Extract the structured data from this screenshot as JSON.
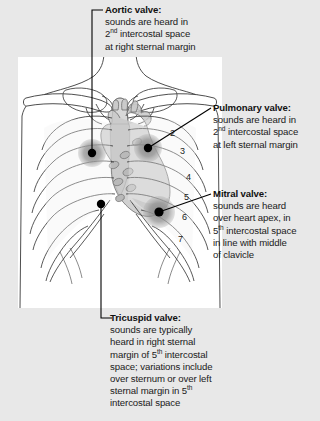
{
  "figure": {
    "title_semantic": "cardiac-auscultation-sites-diagram",
    "background_color": "#e8e8e8",
    "panel_color": "#ffffff"
  },
  "callouts": [
    {
      "id": "aortic",
      "heading": "Aortic valve:",
      "lines": [
        {
          "pre": "sounds are heard in",
          "sup": "",
          "post": ""
        },
        {
          "pre": "2",
          "sup": "nd",
          "post": " intercostal space"
        },
        {
          "pre": "at right sternal margin",
          "sup": "",
          "post": ""
        }
      ]
    },
    {
      "id": "pulmonary",
      "heading": "Pulmonary valve:",
      "lines": [
        {
          "pre": "sounds are heard in",
          "sup": "",
          "post": ""
        },
        {
          "pre": "2",
          "sup": "nd",
          "post": " intercostal space"
        },
        {
          "pre": "at left sternal margin",
          "sup": "",
          "post": ""
        }
      ]
    },
    {
      "id": "mitral",
      "heading": "Mitral valve:",
      "lines": [
        {
          "pre": "sounds are heard",
          "sup": "",
          "post": ""
        },
        {
          "pre": "over heart apex, in",
          "sup": "",
          "post": ""
        },
        {
          "pre": "5",
          "sup": "th",
          "post": " intercostal space"
        },
        {
          "pre": "in line with middle",
          "sup": "",
          "post": ""
        },
        {
          "pre": "of clavicle",
          "sup": "",
          "post": ""
        }
      ]
    },
    {
      "id": "tricuspid",
      "heading": "Tricuspid valve:",
      "lines": [
        {
          "pre": "sounds are typically",
          "sup": "",
          "post": ""
        },
        {
          "pre": "heard in right sternal",
          "sup": "",
          "post": ""
        },
        {
          "pre": "margin of 5",
          "sup": "th",
          "post": " intercostal"
        },
        {
          "pre": "space; variations include",
          "sup": "",
          "post": ""
        },
        {
          "pre": "over sternum or over left",
          "sup": "",
          "post": ""
        },
        {
          "pre": "sternal margin in 5",
          "sup": "th",
          "post": ""
        },
        {
          "pre": "intercostal space",
          "sup": "",
          "post": ""
        }
      ]
    }
  ],
  "rib_numbers": [
    {
      "label": "2",
      "x": 172,
      "y": 132
    },
    {
      "label": "3",
      "x": 182,
      "y": 150
    },
    {
      "label": "4",
      "x": 188,
      "y": 176
    },
    {
      "label": "5",
      "x": 186,
      "y": 196
    },
    {
      "label": "6",
      "x": 184,
      "y": 216
    },
    {
      "label": "7",
      "x": 180,
      "y": 238
    }
  ],
  "auscultation_points": [
    {
      "name": "aortic-point",
      "x": 92,
      "y": 153,
      "patch_r": 14
    },
    {
      "name": "pulmonary-point",
      "x": 148,
      "y": 148,
      "patch_r": 14
    },
    {
      "name": "mitral-point",
      "x": 159,
      "y": 212,
      "patch_r": 16
    },
    {
      "name": "tricuspid-point",
      "x": 101,
      "y": 204,
      "patch_r": 0
    }
  ],
  "colors": {
    "outline": "#3a3a3a",
    "heart_fill": "#c9c9c9",
    "patch_fill": "#8e8e8e",
    "dot": "#000000",
    "text": "#111111"
  }
}
